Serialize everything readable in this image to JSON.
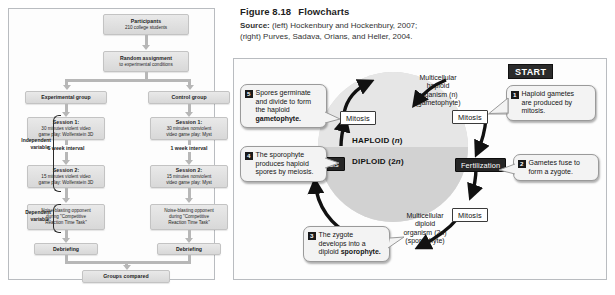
{
  "caption": {
    "figure_number": "Figure 8.18",
    "figure_title": "Flowcharts",
    "source_label": "Source:",
    "source_line1": "(left) Hockenbury and Hockenbury, 2007;",
    "source_line2": "(right) Purves, Sadava, Orians, and Heller, 2004."
  },
  "left_flowchart": {
    "title": "Experiment flowchart",
    "boxes": {
      "participants_t1": "Participants",
      "participants_t2": "210 college students",
      "random_t1": "Random assignment",
      "random_t2": "to experimental conditions",
      "experimental_group": "Experimental group",
      "control_group": "Control group",
      "exp_s1_t1": "Session 1:",
      "exp_s1_t2": "30 minutes violent video",
      "exp_s1_t3": "game play: Wolfenstein 3D",
      "ctl_s1_t1": "Session 1:",
      "ctl_s1_t2": "30 minutes nonviolent",
      "ctl_s1_t3": "video game play: Myst",
      "exp_interval": "1 week interval",
      "ctl_interval": "1 week interval",
      "exp_s2_t1": "Session 2:",
      "exp_s2_t2": "15 minutes violent video",
      "exp_s2_t3": "game play: Wolfenstein 3D",
      "ctl_s2_t1": "Session 2:",
      "ctl_s2_t2": "15 minutes nonviolent",
      "ctl_s2_t3": "video game play: Myst",
      "exp_dv_l1": "Noise-blasting opponent",
      "exp_dv_l2": "during \"Competitive",
      "exp_dv_l3": "Reaction Time Task\"",
      "ctl_dv_l1": "Noise-blasting opponent",
      "ctl_dv_l2": "during \"Competitive",
      "ctl_dv_l3": "Reaction Time Task\"",
      "exp_debriefing": "Debriefing",
      "ctl_debriefing": "Debriefing",
      "groups_compared": "Groups compared"
    },
    "annotations": {
      "independent_l1": "Independent",
      "independent_l2": "variable:",
      "dependent_l1": "Dependent",
      "dependent_l2": "variable:"
    }
  },
  "right_diagram": {
    "title": "Alternation of generations life cycle",
    "start_label": "START",
    "center": {
      "haploid": "HAPLOID (n)",
      "diploid": "DIPLOID (2n)"
    },
    "stages": {
      "mitosis_top_left": "Mitosis",
      "mitosis_top_right": "Mitosis",
      "mitosis_bottom_right": "Mitosis",
      "meiosis": "Meiosis",
      "fertilization": "Fertilization"
    },
    "ring_labels": {
      "haploid_organism_l1": "Multicellular",
      "haploid_organism_l2": "haploid",
      "haploid_organism_l3": "organism (n)",
      "haploid_organism_l4": "(gametophyte)",
      "diploid_organism_l1": "Multicellular",
      "diploid_organism_l2": "diploid",
      "diploid_organism_l3": "organism (2n)",
      "diploid_organism_l4": "(sporophyte)"
    },
    "callouts": [
      {
        "number": "1",
        "line1": "Haploid gametes",
        "line2": "are produced by",
        "line3": "mitosis."
      },
      {
        "number": "2",
        "line1": "Gametes fuse to",
        "line2": "form a zygote.",
        "line3": ""
      },
      {
        "number": "3",
        "line1": "The zygote",
        "line2": "develops into a",
        "line3": "diploid sporophyte."
      },
      {
        "number": "4",
        "line1": "The sporophyte",
        "line2": "produces haploid",
        "line3": "spores by meiosis."
      },
      {
        "number": "5",
        "line1": "Spores germinate",
        "line2": "and divide to form",
        "line3": "the haploid",
        "line4": "gametophyte."
      }
    ]
  },
  "colors": {
    "panel_border": "#b9bcc0",
    "box_fill": "#e4e4e4",
    "arrow_gray": "#b7b7b7",
    "dark_badge": "#262626",
    "circle_haploid": "#e6e6e6",
    "circle_diploid": "#d2d2d2"
  }
}
